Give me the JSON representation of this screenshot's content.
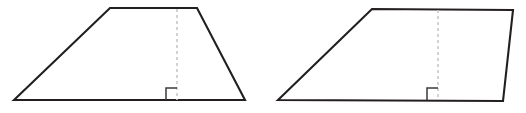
{
  "figure": {
    "background_color": "#ffffff",
    "outline_color": "#231f20",
    "height_line_color": "#c9c9c9",
    "right_angle_color": "#3a3a3a",
    "canvas": {
      "width": 526,
      "height": 113
    }
  },
  "shapes": [
    {
      "name": "trapezoid",
      "label": "Trapezoid",
      "vertices": [
        {
          "x": 14,
          "y": 100
        },
        {
          "x": 110,
          "y": 8
        },
        {
          "x": 197,
          "y": 8
        },
        {
          "x": 245,
          "y": 100
        }
      ],
      "path": "M 14 100 L 110 8 L 197 8 L 245 100 Z",
      "height_line": {
        "x1": 177,
        "y1": 9,
        "x2": 177,
        "y2": 100
      },
      "right_angle_mark": {
        "path": "M 166 100 L 166 88 L 177 88",
        "size": 12
      }
    },
    {
      "name": "parallelogram",
      "label": "Parallelogram",
      "vertices": [
        {
          "x": 278,
          "y": 100
        },
        {
          "x": 372,
          "y": 9
        },
        {
          "x": 513,
          "y": 10
        },
        {
          "x": 503,
          "y": 101
        }
      ],
      "path": "M 278 100 L 372 9 L 513 10 L 503 101 Z",
      "height_line": {
        "x1": 438,
        "y1": 10,
        "x2": 438,
        "y2": 100
      },
      "right_angle_mark": {
        "path": "M 427 100 L 427 88 L 438 88",
        "size": 12
      }
    }
  ]
}
